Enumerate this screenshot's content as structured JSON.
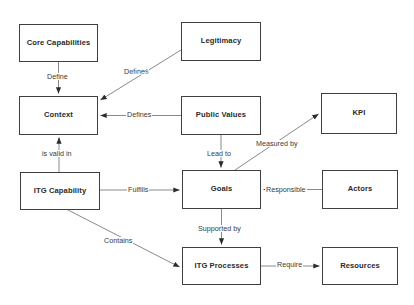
{
  "diagram": {
    "type": "concept-map",
    "canvas": {
      "width": 414,
      "height": 305
    },
    "style": {
      "node_border_color": "#3f3f3f",
      "node_fill_color": "#ffffff",
      "node_text_color": "#2b2b2b",
      "edge_color": "#777777",
      "edge_label_color": "#3a3a3a",
      "background_color": "#ffffff"
    },
    "nodes": [
      {
        "id": "core_capabilities",
        "label": "Core Capabilities",
        "x": 19,
        "y": 24,
        "w": 79,
        "h": 38
      },
      {
        "id": "legitimacy",
        "label": "Legitimacy",
        "x": 181,
        "y": 22,
        "w": 80,
        "h": 39
      },
      {
        "id": "context",
        "label": "Context",
        "x": 19,
        "y": 96,
        "w": 79,
        "h": 39
      },
      {
        "id": "public_values",
        "label": "Public Values",
        "x": 181,
        "y": 96,
        "w": 80,
        "h": 39
      },
      {
        "id": "kpi",
        "label": "KPI",
        "x": 321,
        "y": 93,
        "w": 76,
        "h": 41
      },
      {
        "id": "itg_capability",
        "label": "ITG Capability",
        "x": 20,
        "y": 172,
        "w": 80,
        "h": 38
      },
      {
        "id": "goals",
        "label": "Goals",
        "x": 182,
        "y": 170,
        "w": 79,
        "h": 39
      },
      {
        "id": "actors",
        "label": "Actors",
        "x": 322,
        "y": 170,
        "w": 76,
        "h": 39
      },
      {
        "id": "itg_processes",
        "label": "ITG Processes",
        "x": 182,
        "y": 247,
        "w": 79,
        "h": 38
      },
      {
        "id": "resources",
        "label": "Resources",
        "x": 322,
        "y": 247,
        "w": 76,
        "h": 38
      }
    ],
    "edges": [
      {
        "id": "define",
        "label": "Define",
        "from": "core_capabilities",
        "to": "context",
        "label_x": 46,
        "label_y": 73
      },
      {
        "id": "defines_legitimacy",
        "label": "Defines",
        "from": "legitimacy",
        "to": "context",
        "label_x": 123,
        "label_y": 68
      },
      {
        "id": "defines_public_values",
        "label": "Defines",
        "from": "public_values",
        "to": "context",
        "label_x": 126,
        "label_y": 111
      },
      {
        "id": "is_valid_in",
        "label": "is valid in",
        "from": "itg_capability",
        "to": "context",
        "label_x": 41,
        "label_y": 150
      },
      {
        "id": "lead_to",
        "label": "Lead to",
        "from": "public_values",
        "to": "goals",
        "label_x": 206,
        "label_y": 150
      },
      {
        "id": "measured_by",
        "label": "Measured by",
        "from": "goals",
        "to": "kpi",
        "label_x": 255,
        "label_y": 140
      },
      {
        "id": "fulfills",
        "label": "Fulfills",
        "from": "itg_capability",
        "to": "goals",
        "label_x": 127,
        "label_y": 186
      },
      {
        "id": "responsible",
        "label": "Responsible",
        "from": "actors",
        "to": "goals",
        "label_x": 265,
        "label_y": 186
      },
      {
        "id": "supported_by",
        "label": "Supported by",
        "from": "goals",
        "to": "itg_processes",
        "label_x": 197,
        "label_y": 225
      },
      {
        "id": "contains",
        "label": "Contains",
        "from": "itg_capability",
        "to": "itg_processes",
        "label_x": 103,
        "label_y": 237
      },
      {
        "id": "require",
        "label": "Require",
        "from": "itg_processes",
        "to": "resources",
        "label_x": 276,
        "label_y": 261
      }
    ]
  }
}
